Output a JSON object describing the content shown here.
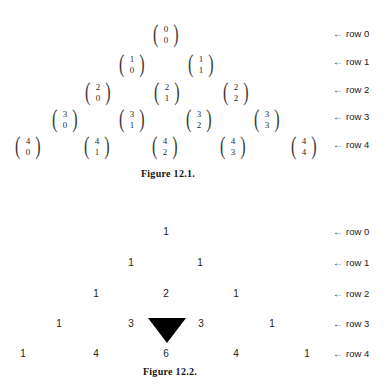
{
  "figure1": {
    "caption": "Figure 12.1.",
    "caption_x": 168,
    "caption_y": 168,
    "cells": [
      {
        "n": "0",
        "k": "0",
        "x": 155,
        "y": 20,
        "row": 0
      },
      {
        "n": "1",
        "k": "0",
        "x": 121,
        "y": 50,
        "row": 1
      },
      {
        "n": "1",
        "k": "1",
        "x": 190,
        "y": 50,
        "row": 1
      },
      {
        "n": "2",
        "k": "0",
        "x": 87,
        "y": 78,
        "row": 2
      },
      {
        "n": "2",
        "k": "1",
        "x": 156,
        "y": 78,
        "row": 2
      },
      {
        "n": "2",
        "k": "2",
        "x": 225,
        "y": 78,
        "row": 2
      },
      {
        "n": "3",
        "k": "0",
        "x": 54,
        "y": 105,
        "row": 3
      },
      {
        "n": "3",
        "k": "1",
        "x": 121,
        "y": 105,
        "row": 3
      },
      {
        "n": "3",
        "k": "2",
        "x": 188,
        "y": 105,
        "row": 3
      },
      {
        "n": "3",
        "k": "3",
        "x": 256,
        "y": 105,
        "row": 3
      },
      {
        "n": "4",
        "k": "0",
        "x": 17,
        "y": 132,
        "row": 4
      },
      {
        "n": "4",
        "k": "1",
        "x": 86,
        "y": 132,
        "row": 4
      },
      {
        "n": "4",
        "k": "2",
        "x": 154,
        "y": 132,
        "row": 4
      },
      {
        "n": "4",
        "k": "3",
        "x": 222,
        "y": 132,
        "row": 4
      },
      {
        "n": "4",
        "k": "4",
        "x": 293,
        "y": 132,
        "row": 4
      }
    ],
    "row_labels": [
      {
        "arrow": "←",
        "text": "row 0",
        "y": 28
      },
      {
        "arrow": "←",
        "text": "row 1",
        "y": 56
      },
      {
        "arrow": "←",
        "text": "row 2",
        "y": 84
      },
      {
        "arrow": "←",
        "text": "row 3",
        "y": 111
      },
      {
        "arrow": "←",
        "text": "row 4",
        "y": 139
      }
    ]
  },
  "figure2": {
    "caption": "Figure 12.2.",
    "caption_x": 170,
    "caption_y": 366,
    "highlight": {
      "value": "6",
      "x": 148,
      "y": 318
    },
    "cells": [
      {
        "value": "1",
        "x": 166,
        "y": 226,
        "row": 0
      },
      {
        "value": "1",
        "x": 131,
        "y": 257,
        "row": 1
      },
      {
        "value": "1",
        "x": 200,
        "y": 257,
        "row": 1
      },
      {
        "value": "1",
        "x": 96,
        "y": 288,
        "row": 2
      },
      {
        "value": "2",
        "x": 166,
        "y": 288,
        "row": 2
      },
      {
        "value": "1",
        "x": 236,
        "y": 288,
        "row": 2
      },
      {
        "value": "1",
        "x": 59,
        "y": 318,
        "row": 3
      },
      {
        "value": "3",
        "x": 131,
        "y": 318,
        "row": 3
      },
      {
        "value": "3",
        "x": 201,
        "y": 318,
        "row": 3
      },
      {
        "value": "1",
        "x": 272,
        "y": 318,
        "row": 3
      },
      {
        "value": "1",
        "x": 23,
        "y": 348,
        "row": 4
      },
      {
        "value": "4",
        "x": 96,
        "y": 348,
        "row": 4
      },
      {
        "value": "6",
        "x": 166,
        "y": 348,
        "row": 4
      },
      {
        "value": "4",
        "x": 236,
        "y": 348,
        "row": 4
      },
      {
        "value": "1",
        "x": 307,
        "y": 348,
        "row": 4
      }
    ],
    "row_labels": [
      {
        "arrow": "←",
        "text": "row 0",
        "y": 226
      },
      {
        "arrow": "←",
        "text": "row 1",
        "y": 257
      },
      {
        "arrow": "←",
        "text": "row 2",
        "y": 288
      },
      {
        "arrow": "←",
        "text": "row 3",
        "y": 318
      },
      {
        "arrow": "←",
        "text": "row 4",
        "y": 348
      }
    ]
  },
  "label_x": {
    "arrow": 333,
    "text": 333
  }
}
